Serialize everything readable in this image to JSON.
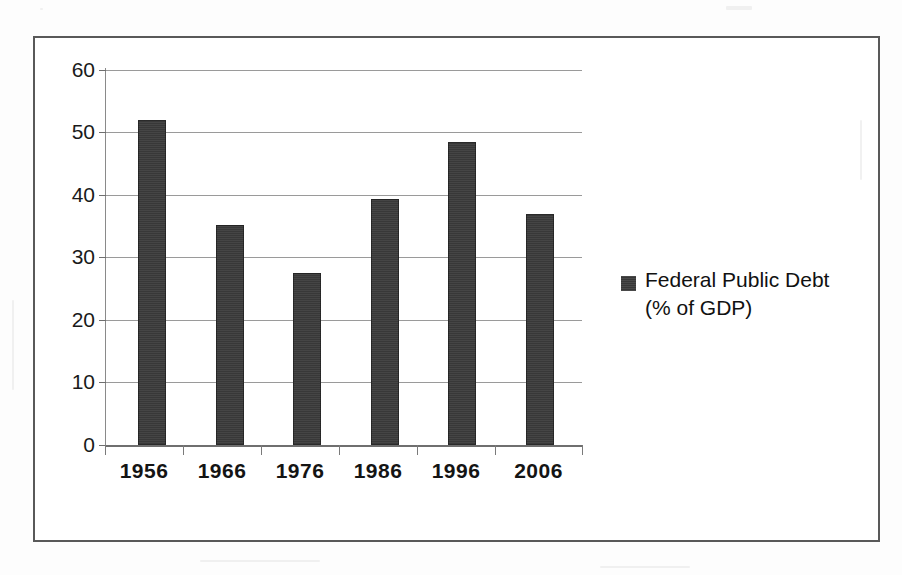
{
  "chart_data": {
    "type": "bar",
    "title": "",
    "xlabel": "",
    "ylabel": "",
    "categories": [
      "1956",
      "1966",
      "1976",
      "1986",
      "1996",
      "2006"
    ],
    "values": [
      52,
      35.2,
      27.5,
      39.3,
      48.5,
      37
    ],
    "series": [
      {
        "name": "Federal Public Debt (% of GDP)",
        "values": [
          52,
          35.2,
          27.5,
          39.3,
          48.5,
          37
        ]
      }
    ],
    "ylim": [
      0,
      60
    ],
    "yticks": [
      0,
      10,
      20,
      30,
      40,
      50,
      60
    ],
    "ytick_labels": [
      "0",
      "10",
      "20",
      "30",
      "40",
      "50",
      "60"
    ],
    "grid": true,
    "legend_position": "right",
    "bar_color": "#3b3b3b"
  },
  "legend": {
    "marker_name": "series-color-swatch",
    "line1": "Federal Public Debt",
    "line2": "(% of GDP)"
  },
  "axes": {
    "y_tick_labels": [
      "60",
      "50",
      "40",
      "30",
      "20",
      "10",
      "0"
    ],
    "x_tick_labels": [
      "1956",
      "1966",
      "1976",
      "1986",
      "1996",
      "2006"
    ]
  },
  "colors": {
    "bar": "#3b3b3b",
    "frame_border": "#595959",
    "gridline": "#9a9a9a",
    "axis": "#6f6f6f",
    "text": "#141414",
    "page_background": "#fdfdfd"
  }
}
